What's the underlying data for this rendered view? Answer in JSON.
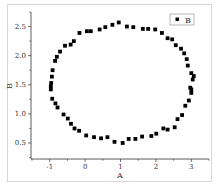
{
  "chart_data": {
    "type": "scatter",
    "title": "",
    "xlabel": "A",
    "ylabel": "B",
    "xlim": [
      -1.53,
      3.5
    ],
    "ylim": [
      0.225,
      2.75
    ],
    "xticks": [
      -1,
      0,
      1,
      2,
      3
    ],
    "xtick_labels": [
      "-1",
      "0",
      "1",
      "2",
      "3"
    ],
    "yticks": [
      0.5,
      1.0,
      1.5,
      2.0,
      2.5
    ],
    "ytick_labels": [
      "0.5",
      "1.0",
      "1.5",
      "2.0",
      "2.5"
    ],
    "grid": false,
    "legend_position": "upper right",
    "series": [
      {
        "name": "B",
        "marker": "square",
        "color": "#000000",
        "x": [
          -0.97,
          -0.97,
          -0.96,
          -0.94,
          -0.92,
          -0.85,
          -0.8,
          -0.71,
          -0.57,
          -0.41,
          -0.32,
          -0.16,
          0.05,
          0.16,
          0.41,
          0.57,
          0.77,
          0.95,
          1.18,
          1.36,
          1.63,
          1.78,
          1.98,
          2.17,
          2.33,
          2.46,
          2.56,
          2.71,
          2.8,
          2.87,
          2.9,
          3.0,
          3.07,
          3.04,
          3.0,
          3.0,
          2.97,
          2.93,
          2.83,
          2.74,
          2.61,
          2.53,
          2.33,
          2.21,
          2.01,
          1.87,
          1.61,
          1.42,
          1.23,
          1.06,
          0.83,
          0.63,
          0.45,
          0.25,
          0.03,
          -0.17,
          -0.3,
          -0.4,
          -0.49,
          -0.61,
          -0.78,
          -0.84,
          -0.93
        ],
        "y": [
          1.47,
          1.42,
          1.53,
          1.64,
          1.75,
          1.91,
          1.98,
          2.07,
          2.17,
          2.19,
          2.25,
          2.39,
          2.42,
          2.42,
          2.45,
          2.49,
          2.53,
          2.57,
          2.5,
          2.49,
          2.46,
          2.46,
          2.45,
          2.39,
          2.3,
          2.28,
          2.18,
          2.12,
          2.04,
          1.94,
          1.83,
          1.7,
          1.65,
          1.59,
          1.42,
          1.36,
          1.45,
          1.23,
          1.14,
          0.98,
          0.91,
          0.77,
          0.73,
          0.75,
          0.66,
          0.62,
          0.61,
          0.57,
          0.57,
          0.5,
          0.52,
          0.6,
          0.58,
          0.6,
          0.63,
          0.71,
          0.75,
          0.83,
          0.92,
          0.99,
          1.11,
          1.18,
          1.26
        ]
      }
    ]
  },
  "colors": {
    "marker": "#000000",
    "axis": "#333333",
    "frame": "#d8d8d8"
  }
}
